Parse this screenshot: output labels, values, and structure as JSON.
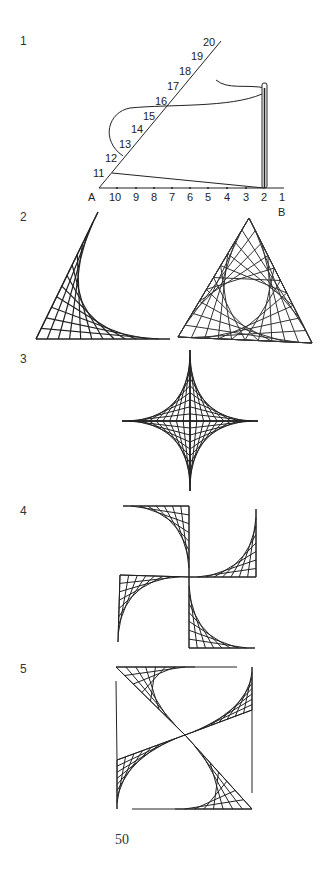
{
  "figures": [
    {
      "label": "1",
      "description": "Angle AB with 20 numbered points, needle threading from 11 to 2"
    },
    {
      "label": "2",
      "description": "String curve in right angle and triangle with overlapping curves"
    },
    {
      "label": "3",
      "description": "Four-pointed star (astroid) string pattern"
    },
    {
      "label": "4",
      "description": "Pinwheel of four quarter-curve string patterns"
    },
    {
      "label": "5",
      "description": "Square with diagonal string curve pattern"
    }
  ],
  "figure1": {
    "point_A": "A",
    "point_B": "B",
    "base_numbers": [
      "10",
      "9",
      "8",
      "7",
      "6",
      "5",
      "4",
      "3",
      "2",
      "1"
    ],
    "diagonal_numbers": [
      "11",
      "12",
      "13",
      "14",
      "15",
      "16",
      "17",
      "18",
      "19",
      "20"
    ]
  },
  "page_number": "50"
}
